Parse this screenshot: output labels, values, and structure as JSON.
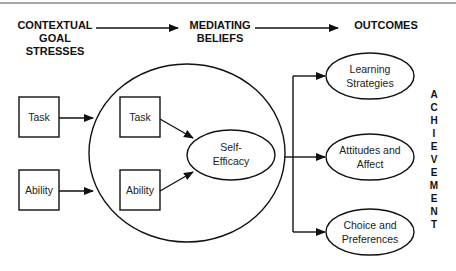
{
  "diagram": {
    "headers": {
      "contextual": [
        "CONTEXTUAL",
        "GOAL",
        "STRESSES"
      ],
      "mediating": [
        "MEDIATING",
        "BELIEFS"
      ],
      "outcomes": [
        "OUTCOMES"
      ]
    },
    "stress_boxes": [
      "Task",
      "Ability"
    ],
    "belief_boxes": [
      "Task",
      "Ability"
    ],
    "self_efficacy": [
      "Self-",
      "Efficacy"
    ],
    "outcomes": [
      [
        "Learning",
        "Strategies"
      ],
      [
        "Attitudes and",
        "Affect"
      ],
      [
        "Choice and",
        "Preferences"
      ]
    ],
    "achievement_letters": [
      "A",
      "C",
      "H",
      "I",
      "E",
      "V",
      "E",
      "M",
      "E",
      "N",
      "T"
    ],
    "colors": {
      "line": "#111111",
      "background": "#ffffff",
      "top_rule": "#888888"
    }
  }
}
